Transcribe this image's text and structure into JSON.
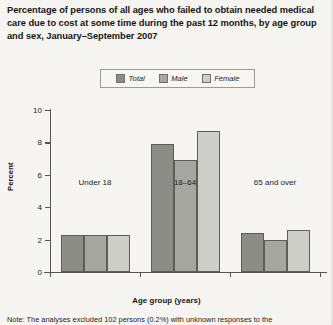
{
  "figure": {
    "title": "Percentage of persons of all ages who failed to obtain needed medical care due to cost at some time during the past 12 months, by age group and sex, January–September 2007",
    "footnote": "Note: The analyses excluded 102 persons (0.2%) with unknown responses to the"
  },
  "legend": {
    "items": [
      {
        "label": "Total",
        "color": "#8e8e88",
        "name": "total"
      },
      {
        "label": "Male",
        "color": "#a8a8a2",
        "name": "male"
      },
      {
        "label": "Female",
        "color": "#cfcfc9",
        "name": "female"
      }
    ]
  },
  "axes": {
    "y_title": "Percent",
    "x_title": "Age group (years)",
    "y_ticks": [
      "0",
      "2",
      "4",
      "6",
      "8",
      "10"
    ]
  },
  "chart_data": {
    "type": "bar",
    "title": "Percentage of persons of all ages who failed to obtain needed medical care due to cost at some time during the past 12 months, by age group and sex, January–September 2007",
    "xlabel": "Age group (years)",
    "ylabel": "Percent",
    "ylim": [
      0,
      10
    ],
    "ytick_interval": 2,
    "grid": false,
    "legend_position": "top-center",
    "categories": [
      "Under 18",
      "18–64",
      "65 and over"
    ],
    "series": [
      {
        "name": "Total",
        "color": "#8e8e88",
        "values": [
          2.3,
          7.9,
          2.4
        ]
      },
      {
        "name": "Male",
        "color": "#a8a8a2",
        "values": [
          2.3,
          6.9,
          2.0
        ]
      },
      {
        "name": "Female",
        "color": "#cfcfc9",
        "values": [
          2.3,
          8.7,
          2.6
        ]
      }
    ]
  }
}
